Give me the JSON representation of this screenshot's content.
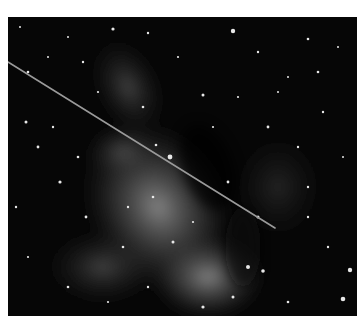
{
  "image": {
    "subject": "Milky Way star field with a streak across the sky",
    "background_color": "#060606",
    "glow_color": "#8a8a8a",
    "streak": {
      "x1": 0,
      "y1": 45,
      "x2": 267,
      "y2": 211,
      "color": "#9a9a9a"
    }
  }
}
